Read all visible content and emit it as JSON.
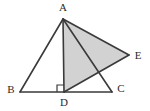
{
  "figure": {
    "name": "geometry-figure-triangle-abc-with-shaded-triangle-ade",
    "background_color": "#ffffff",
    "stroke_color": "#3a3a3a",
    "shade_color": "#d2d2d2",
    "label_color": "#2b2b2b",
    "canvas": {
      "width": 150,
      "height": 111
    }
  },
  "points": {
    "A": {
      "label": "A",
      "x": 63,
      "y": 19,
      "label_x": 63,
      "label_y": 8
    },
    "B": {
      "label": "B",
      "x": 20,
      "y": 92,
      "label_x": 11,
      "label_y": 90
    },
    "C": {
      "label": "C",
      "x": 112,
      "y": 92,
      "label_x": 121,
      "label_y": 89
    },
    "D": {
      "label": "D",
      "x": 64,
      "y": 92,
      "label_x": 64,
      "label_y": 103
    },
    "E": {
      "label": "E",
      "x": 129,
      "y": 55,
      "label_x": 138,
      "label_y": 56
    }
  },
  "segments": [
    {
      "name": "segment-AB",
      "from": "A",
      "to": "B"
    },
    {
      "name": "segment-BC",
      "from": "B",
      "to": "C"
    },
    {
      "name": "segment-AD",
      "from": "A",
      "to": "D"
    },
    {
      "name": "segment-AC",
      "from": "A",
      "to": "C"
    },
    {
      "name": "segment-AE",
      "from": "A",
      "to": "E"
    },
    {
      "name": "segment-DE",
      "from": "D",
      "to": "E"
    }
  ],
  "shaded_region": {
    "name": "shaded-triangle-ADE",
    "vertices": [
      "A",
      "D",
      "E"
    ],
    "fill": "#d2d2d2"
  },
  "right_angle": {
    "name": "right-angle-marker-at-D",
    "at": "D",
    "size": 7,
    "description": "square marker indicating AD perpendicular to BC"
  }
}
